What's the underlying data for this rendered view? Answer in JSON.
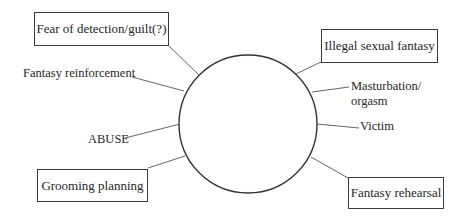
{
  "diagram": {
    "type": "cycle-spoke",
    "center": {
      "shape": "circle",
      "cx": 248,
      "cy": 124,
      "r": 69
    },
    "boxed_nodes": [
      {
        "id": "fear",
        "label": "Fear of detection/guilt(?)"
      },
      {
        "id": "illegal",
        "label": "Illegal sexual fantasy"
      },
      {
        "id": "grooming",
        "label": "Grooming planning"
      },
      {
        "id": "rehearsal",
        "label": "Fantasy rehearsal"
      }
    ],
    "free_nodes": [
      {
        "id": "reinforcement",
        "label": "Fantasy reinforcement"
      },
      {
        "id": "masturbation",
        "label_line1": "Masturbation/",
        "label_line2": "orgasm"
      },
      {
        "id": "victim",
        "label": "Victim"
      },
      {
        "id": "abuse",
        "label": "ABUSE"
      }
    ],
    "colors": {
      "stroke": "#333333",
      "connector": "#555555",
      "text": "#262626",
      "background": "#ffffff"
    }
  }
}
